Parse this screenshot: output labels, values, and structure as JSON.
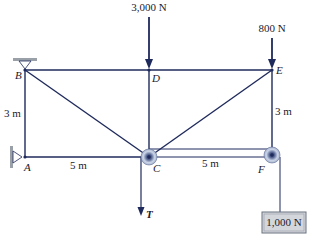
{
  "diagram": {
    "type": "truss-with-pulleys",
    "colors": {
      "member": "#1f2a5c",
      "support": "#9aa0a8",
      "pulley_fill": "#c9d3e6",
      "box_fill": "#d3d6db",
      "text": "#1a1a2e"
    },
    "nodes": {
      "A": {
        "label": "A"
      },
      "B": {
        "label": "B"
      },
      "C": {
        "label": "C"
      },
      "D": {
        "label": "D"
      },
      "E": {
        "label": "E"
      },
      "F": {
        "label": "F"
      }
    },
    "loads": {
      "load_D": "3,000 N",
      "load_E": "800 N",
      "tension": "T",
      "weight": "1,000 N"
    },
    "dimensions": {
      "height_left": "3 m",
      "height_right": "3 m",
      "span_AC": "5 m",
      "span_CF": "5 m"
    }
  }
}
